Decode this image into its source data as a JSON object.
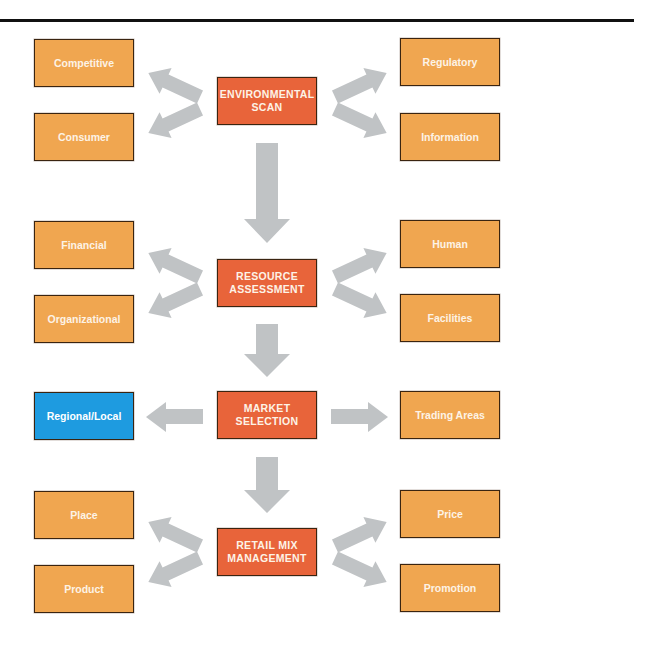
{
  "diagram": {
    "colors": {
      "core": "#e8643a",
      "side": "#f0a650",
      "highlight": "#1e9be0",
      "arrow": "#c0c3c5",
      "rule": "#111111"
    },
    "stages": [
      {
        "label": "ENVIRONMENTAL SCAN",
        "left": [
          "Competitive",
          "Consumer"
        ],
        "right": [
          "Regulatory",
          "Information"
        ]
      },
      {
        "label": "RESOURCE ASSESSMENT",
        "left": [
          "Financial",
          "Organizational"
        ],
        "right": [
          "Human",
          "Facilities"
        ]
      },
      {
        "label": "MARKET SELECTION",
        "left": [
          "Regional/Local"
        ],
        "right": [
          "Trading Areas"
        ],
        "highlighted": "Regional/Local"
      },
      {
        "label": "RETAIL MIX MANAGEMENT",
        "left": [
          "Place",
          "Product"
        ],
        "right": [
          "Price",
          "Promotion"
        ]
      }
    ]
  }
}
